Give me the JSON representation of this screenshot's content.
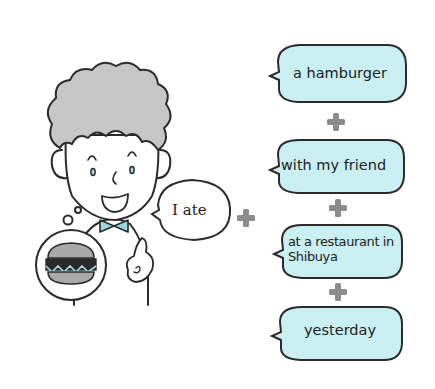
{
  "figure": {
    "colors": {
      "bubble_fill": "#c9eff3",
      "outline": "#2b2b2b",
      "plus": "#8c8c8c",
      "hair": "#c6c6c6",
      "bowtie": "#9fd9de",
      "burger_bun": "#a9a9a9",
      "burger_patty": "#2a2a2a"
    }
  },
  "speaker": {
    "bubble_text": "I ate",
    "thought_item": "hamburger"
  },
  "phrases": [
    {
      "text": "a hamburger"
    },
    {
      "text": "with my friend"
    },
    {
      "text": "at a restaurant in Shibuya"
    },
    {
      "text": "yesterday"
    }
  ],
  "connectors": [
    "+",
    "+",
    "+",
    "+"
  ]
}
